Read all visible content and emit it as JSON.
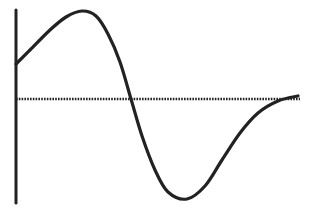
{
  "chart_data": {
    "type": "line",
    "title": "",
    "xlabel": "",
    "ylabel": "",
    "grid": false,
    "legend": null,
    "series": [
      {
        "name": "curve",
        "points_px": [
          [
            16,
            64
          ],
          [
            30,
            50
          ],
          [
            50,
            30
          ],
          [
            66,
            17
          ],
          [
            82,
            11
          ],
          [
            96,
            16
          ],
          [
            108,
            34
          ],
          [
            120,
            62
          ],
          [
            131,
            99
          ],
          [
            142,
            136
          ],
          [
            155,
            170
          ],
          [
            168,
            192
          ],
          [
            187,
            199
          ],
          [
            205,
            186
          ],
          [
            222,
            160
          ],
          [
            240,
            133
          ],
          [
            258,
            113
          ],
          [
            278,
            101
          ],
          [
            298,
            96
          ]
        ],
        "values_normalized": [
          0.4,
          0.55,
          0.75,
          0.93,
          1.0,
          0.95,
          0.73,
          0.42,
          0.0,
          -0.37,
          -0.71,
          -0.93,
          -1.0,
          -0.87,
          -0.61,
          -0.34,
          -0.14,
          -0.02,
          0.03
        ]
      }
    ],
    "axes": {
      "y_axis_x_px": 16,
      "y_axis_range_px": [
        10,
        203
      ],
      "x_axis_y_px": 99,
      "x_axis_range_px": [
        16,
        300
      ],
      "x_axis_style": "dotted"
    },
    "colors": {
      "line": "#222222",
      "background": "#ffffff"
    }
  }
}
